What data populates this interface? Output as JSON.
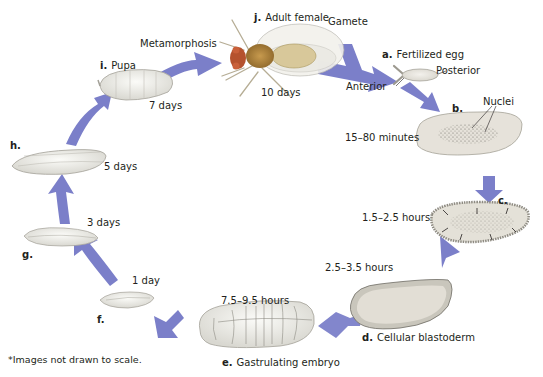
{
  "diagram": {
    "arrow_color": "#7b7fc9",
    "stages": [
      {
        "letter": "a.",
        "name": "Fertilized egg"
      },
      {
        "letter": "b.",
        "name": ""
      },
      {
        "letter": "c.",
        "name": ""
      },
      {
        "letter": "d.",
        "name": "Cellular blastoderm"
      },
      {
        "letter": "e.",
        "name": "Gastrulating embryo"
      },
      {
        "letter": "f.",
        "name": ""
      },
      {
        "letter": "g.",
        "name": ""
      },
      {
        "letter": "h.",
        "name": ""
      },
      {
        "letter": "i.",
        "name": "Pupa"
      },
      {
        "letter": "j.",
        "name": "Adult female"
      }
    ],
    "times": {
      "b": "15–80 minutes",
      "c": "1.5–2.5 hours",
      "d": "2.5–3.5 hours",
      "e": "7.5–9.5 hours",
      "f": "1 day",
      "g": "3 days",
      "h": "5 days",
      "i": "7 days",
      "j": "10 days"
    },
    "annotations": {
      "gamete": "Gamete",
      "metamorphosis": "Metamorphosis",
      "anterior": "Anterior",
      "posterior": "Posterior",
      "nuclei": "Nuclei"
    },
    "footnote": "*Images not drawn to scale."
  }
}
